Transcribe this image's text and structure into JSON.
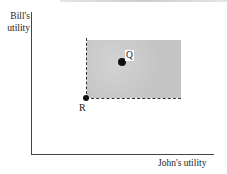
{
  "diagram": {
    "type": "utility-possibility",
    "y_axis_label_line1": "Bill's",
    "y_axis_label_line2": "utility",
    "x_axis_label": "John's utility",
    "points": [
      {
        "id": "R",
        "label": "R",
        "description": "reference point at lower-left corner of shaded region"
      },
      {
        "id": "Q",
        "label": "Q",
        "description": "point inside shaded region (Pareto improvement over R)"
      }
    ],
    "shaded_region": "area above and to the right of R bounded by dashed lines",
    "colors": {
      "shading": "#c9c9c9",
      "lines": "#333333",
      "points": "#111111"
    }
  }
}
